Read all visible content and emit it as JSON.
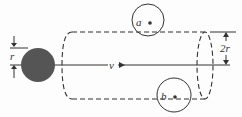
{
  "diagram": {
    "type": "physics-cylinder-sweep",
    "labels": {
      "radius": "r",
      "velocity": "v",
      "diameter": "2r",
      "particle_a": "a",
      "particle_b": "b"
    },
    "colors": {
      "stroke": "#333333",
      "projectile_fill": "#555555",
      "background": "#fdfdfd"
    }
  }
}
